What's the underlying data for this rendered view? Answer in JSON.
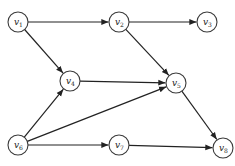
{
  "diagram": {
    "type": "directed-graph",
    "nodes": [
      {
        "id": "v1",
        "base": "v",
        "sub": "1",
        "x": 18,
        "y": 22
      },
      {
        "id": "v2",
        "base": "v",
        "sub": "2",
        "x": 119,
        "y": 22
      },
      {
        "id": "v3",
        "base": "v",
        "sub": "3",
        "x": 207,
        "y": 22
      },
      {
        "id": "v4",
        "base": "v",
        "sub": "4",
        "x": 70,
        "y": 81
      },
      {
        "id": "v5",
        "base": "v",
        "sub": "5",
        "x": 176,
        "y": 83
      },
      {
        "id": "v6",
        "base": "v",
        "sub": "6",
        "x": 18,
        "y": 145
      },
      {
        "id": "v7",
        "base": "v",
        "sub": "7",
        "x": 119,
        "y": 145
      },
      {
        "id": "v8",
        "base": "v",
        "sub": "8",
        "x": 223,
        "y": 148
      }
    ],
    "edges": [
      {
        "from": "v1",
        "to": "v2"
      },
      {
        "from": "v2",
        "to": "v3"
      },
      {
        "from": "v1",
        "to": "v4"
      },
      {
        "from": "v2",
        "to": "v5"
      },
      {
        "from": "v4",
        "to": "v5"
      },
      {
        "from": "v6",
        "to": "v4"
      },
      {
        "from": "v6",
        "to": "v5"
      },
      {
        "from": "v6",
        "to": "v7"
      },
      {
        "from": "v7",
        "to": "v8"
      },
      {
        "from": "v5",
        "to": "v8"
      }
    ],
    "node_radius": 10,
    "colors": {
      "stroke": "#3a3a3a",
      "edge": "#222222",
      "fill": "#ffffff"
    }
  }
}
